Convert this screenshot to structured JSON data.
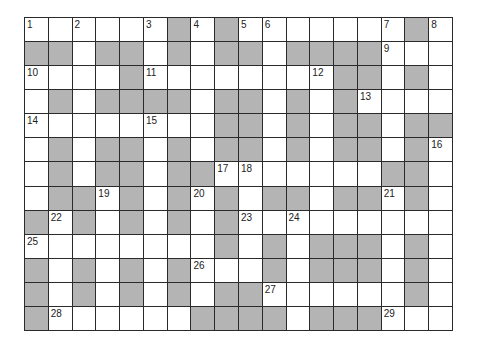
{
  "puzzle": {
    "cols": 18,
    "rows": 13,
    "colors": {
      "block": "#b4b4b4",
      "open": "#ffffff",
      "border": "#2a2a2a"
    },
    "grid": [
      "111111010111111101",
      "001001010010000111",
      "111101111111100101",
      "101000010010101111",
      "111111110010100100",
      "101001010010100101",
      "101001001111111001",
      "100101010100100101",
      "010101010111111111",
      "111111110101000101",
      "010101011101000101",
      "010101010011111101",
      "011111100001000111"
    ],
    "numbers": [
      {
        "r": 0,
        "c": 0,
        "n": "1"
      },
      {
        "r": 0,
        "c": 2,
        "n": "2"
      },
      {
        "r": 0,
        "c": 5,
        "n": "3"
      },
      {
        "r": 0,
        "c": 7,
        "n": "4"
      },
      {
        "r": 0,
        "c": 9,
        "n": "5"
      },
      {
        "r": 0,
        "c": 10,
        "n": "6"
      },
      {
        "r": 0,
        "c": 15,
        "n": "7"
      },
      {
        "r": 0,
        "c": 17,
        "n": "8"
      },
      {
        "r": 1,
        "c": 15,
        "n": "9"
      },
      {
        "r": 2,
        "c": 0,
        "n": "10"
      },
      {
        "r": 2,
        "c": 5,
        "n": "11"
      },
      {
        "r": 2,
        "c": 12,
        "n": "12"
      },
      {
        "r": 3,
        "c": 14,
        "n": "13"
      },
      {
        "r": 4,
        "c": 0,
        "n": "14"
      },
      {
        "r": 4,
        "c": 5,
        "n": "15"
      },
      {
        "r": 5,
        "c": 17,
        "n": "16"
      },
      {
        "r": 6,
        "c": 8,
        "n": "17"
      },
      {
        "r": 6,
        "c": 9,
        "n": "18"
      },
      {
        "r": 7,
        "c": 3,
        "n": "19"
      },
      {
        "r": 7,
        "c": 7,
        "n": "20"
      },
      {
        "r": 7,
        "c": 15,
        "n": "21"
      },
      {
        "r": 8,
        "c": 1,
        "n": "22"
      },
      {
        "r": 8,
        "c": 9,
        "n": "23"
      },
      {
        "r": 8,
        "c": 11,
        "n": "24"
      },
      {
        "r": 9,
        "c": 0,
        "n": "25"
      },
      {
        "r": 10,
        "c": 7,
        "n": "26"
      },
      {
        "r": 11,
        "c": 10,
        "n": "27"
      },
      {
        "r": 12,
        "c": 1,
        "n": "28"
      },
      {
        "r": 12,
        "c": 15,
        "n": "29"
      }
    ]
  }
}
